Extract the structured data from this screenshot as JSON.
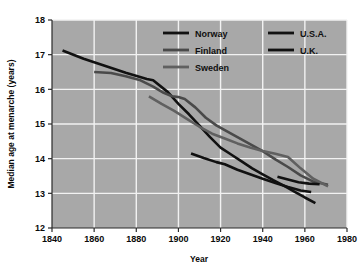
{
  "figure": {
    "background": "#ffffff",
    "plot_background": "#a8a8a8",
    "grid_color": "#f2f2f2",
    "axis_color": "#2b2b2b"
  },
  "chart_data": {
    "type": "line",
    "title": "",
    "xlabel": "Year",
    "ylabel": "Median age at menarche (years)",
    "xlim": [
      1840,
      1980
    ],
    "ylim": [
      12,
      18
    ],
    "xticks": [
      1840,
      1860,
      1880,
      1900,
      1920,
      1940,
      1960,
      1980
    ],
    "yticks": [
      12,
      13,
      14,
      15,
      16,
      17,
      18
    ],
    "xtick_labels": [
      "1840",
      "1860",
      "1880",
      "1900",
      "1920",
      "1940",
      "1960",
      "1980"
    ],
    "ytick_labels": [
      "12",
      "13",
      "14",
      "15",
      "16",
      "17",
      "18"
    ],
    "grid": true,
    "grid_style": "white solid lines, both axes",
    "legend_position": "upper right inside plot area",
    "series": [
      {
        "name": "Norway",
        "color": "#111111",
        "width": 2.6,
        "points": [
          [
            1845,
            17.12
          ],
          [
            1855,
            16.88
          ],
          [
            1865,
            16.68
          ],
          [
            1875,
            16.48
          ],
          [
            1885,
            16.3
          ],
          [
            1888,
            16.26
          ],
          [
            1895,
            15.92
          ],
          [
            1900,
            15.58
          ],
          [
            1905,
            15.28
          ],
          [
            1910,
            14.95
          ],
          [
            1915,
            14.62
          ],
          [
            1920,
            14.32
          ],
          [
            1925,
            14.12
          ],
          [
            1930,
            13.92
          ],
          [
            1935,
            13.72
          ],
          [
            1940,
            13.55
          ],
          [
            1945,
            13.38
          ],
          [
            1950,
            13.22
          ],
          [
            1955,
            13.05
          ],
          [
            1960,
            12.88
          ],
          [
            1965,
            12.72
          ]
        ]
      },
      {
        "name": "Finland",
        "color": "#4a4a4a",
        "width": 2.6,
        "points": [
          [
            1860,
            16.5
          ],
          [
            1868,
            16.47
          ],
          [
            1875,
            16.38
          ],
          [
            1882,
            16.26
          ],
          [
            1888,
            16.08
          ],
          [
            1893,
            15.9
          ],
          [
            1897,
            15.8
          ],
          [
            1900,
            15.78
          ],
          [
            1903,
            15.72
          ],
          [
            1908,
            15.48
          ],
          [
            1913,
            15.18
          ],
          [
            1918,
            14.96
          ],
          [
            1922,
            14.82
          ],
          [
            1928,
            14.62
          ],
          [
            1934,
            14.42
          ],
          [
            1940,
            14.22
          ],
          [
            1946,
            13.98
          ],
          [
            1952,
            13.76
          ],
          [
            1958,
            13.52
          ],
          [
            1964,
            13.34
          ],
          [
            1971,
            13.25
          ]
        ]
      },
      {
        "name": "Sweden",
        "color": "#606060",
        "width": 2.6,
        "points": [
          [
            1886,
            15.8
          ],
          [
            1892,
            15.58
          ],
          [
            1898,
            15.38
          ],
          [
            1904,
            15.15
          ],
          [
            1910,
            14.92
          ],
          [
            1916,
            14.72
          ],
          [
            1922,
            14.58
          ],
          [
            1928,
            14.44
          ],
          [
            1934,
            14.32
          ],
          [
            1940,
            14.22
          ],
          [
            1946,
            14.14
          ],
          [
            1952,
            14.05
          ],
          [
            1958,
            13.72
          ],
          [
            1964,
            13.42
          ],
          [
            1971,
            13.2
          ]
        ]
      },
      {
        "name": "U.S.A.",
        "color": "#111111",
        "width": 2.6,
        "points": [
          [
            1906,
            14.15
          ],
          [
            1912,
            14.02
          ],
          [
            1918,
            13.9
          ],
          [
            1922,
            13.84
          ],
          [
            1928,
            13.68
          ],
          [
            1934,
            13.55
          ],
          [
            1940,
            13.42
          ],
          [
            1946,
            13.3
          ],
          [
            1952,
            13.18
          ],
          [
            1958,
            13.08
          ],
          [
            1963,
            13.04
          ]
        ]
      },
      {
        "name": "U.K.",
        "color": "#111111",
        "width": 2.6,
        "points": [
          [
            1947,
            13.48
          ],
          [
            1952,
            13.4
          ],
          [
            1957,
            13.32
          ],
          [
            1962,
            13.28
          ],
          [
            1967,
            13.26
          ]
        ]
      }
    ]
  },
  "legend": {
    "entries": [
      {
        "label": "Norway",
        "color": "#111111"
      },
      {
        "label": "Finland",
        "color": "#4a4a4a"
      },
      {
        "label": "Sweden",
        "color": "#606060"
      },
      {
        "label": "U.S.A.",
        "color": "#111111"
      },
      {
        "label": "U.K.",
        "color": "#111111"
      }
    ]
  }
}
